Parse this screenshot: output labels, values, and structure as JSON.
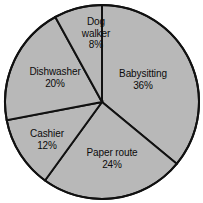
{
  "chart_data": {
    "type": "pie",
    "title": "",
    "subtitle": "",
    "xlabel": "",
    "ylabel": "",
    "legend": "none",
    "grid": false,
    "start_angle_deg": 0,
    "direction": "clockwise",
    "categories": [
      "Babysitting",
      "Paper route",
      "Cashier",
      "Dishwasher",
      "Dog walker"
    ],
    "values": [
      36,
      24,
      12,
      20,
      8
    ],
    "value_unit": "%",
    "slices": [
      {
        "name": "Babysitting",
        "value": 36,
        "label": "Babysitting",
        "value_label": "36%",
        "start_deg": 0,
        "end_deg": 129.6,
        "label_x": 143,
        "label_y": 79,
        "narrow": false
      },
      {
        "name": "Paper route",
        "value": 24,
        "label": "Paper route",
        "value_label": "24%",
        "start_deg": 129.6,
        "end_deg": 216,
        "label_x": 112,
        "label_y": 158,
        "narrow": false
      },
      {
        "name": "Cashier",
        "value": 12,
        "label": "Cashier",
        "value_label": "12%",
        "start_deg": 216,
        "end_deg": 259.2,
        "label_x": 47,
        "label_y": 139,
        "narrow": false
      },
      {
        "name": "Dishwasher",
        "value": 20,
        "label": "Dishwasher",
        "value_label": "20%",
        "start_deg": 259.2,
        "end_deg": 331.2,
        "label_x": 55,
        "label_y": 77,
        "narrow": false
      },
      {
        "name": "Dog walker",
        "value": 8,
        "label": "Dog walker",
        "value_label": "8%",
        "start_deg": 331.2,
        "end_deg": 360,
        "label_x": 96,
        "label_y": 33,
        "narrow": true
      }
    ],
    "geometry": {
      "center_x": 102,
      "center_y": 102,
      "radius": 97
    },
    "colors": {
      "slice_fill": "#b8b8b8",
      "stroke": "#111111",
      "background": "#ffffff",
      "label_text": "#0b0b0b"
    }
  }
}
